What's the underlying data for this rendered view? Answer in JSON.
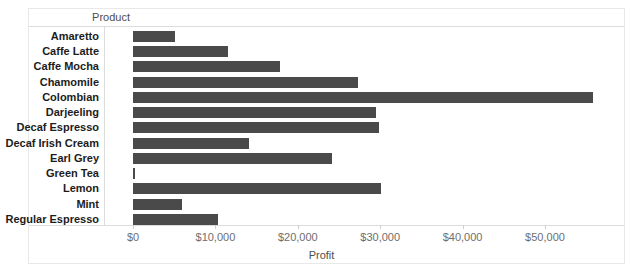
{
  "chart_data": {
    "type": "bar",
    "orientation": "horizontal",
    "title": "",
    "xlabel": "Profit",
    "ylabel": "Product",
    "categories": [
      "Amaretto",
      "Caffe Latte",
      "Caffe Mocha",
      "Chamomile",
      "Colombian",
      "Darjeeling",
      "Decaf Espresso",
      "Decaf Irish Cream",
      "Earl Grey",
      "Green Tea",
      "Lemon",
      "Mint",
      "Regular Espresso"
    ],
    "values": [
      5100,
      11500,
      17900,
      27300,
      55800,
      29500,
      29900,
      14100,
      24100,
      250,
      30100,
      6000,
      10300
    ],
    "xlim": [
      0,
      58000
    ],
    "xticks": [
      0,
      10000,
      20000,
      30000,
      40000,
      50000
    ],
    "xticklabels": [
      "$0",
      "$10,000",
      "$20,000",
      "$30,000",
      "$40,000",
      "$50,000"
    ],
    "grid": false,
    "legend": false,
    "bar_color": "#4a4a4a",
    "axis_color": "#dcdcdc",
    "label_color": "#1c1c1c",
    "tick_color": "#6e6e6e"
  },
  "axes": {
    "y_field_caption": "Product",
    "x_axis_title": "Profit"
  }
}
